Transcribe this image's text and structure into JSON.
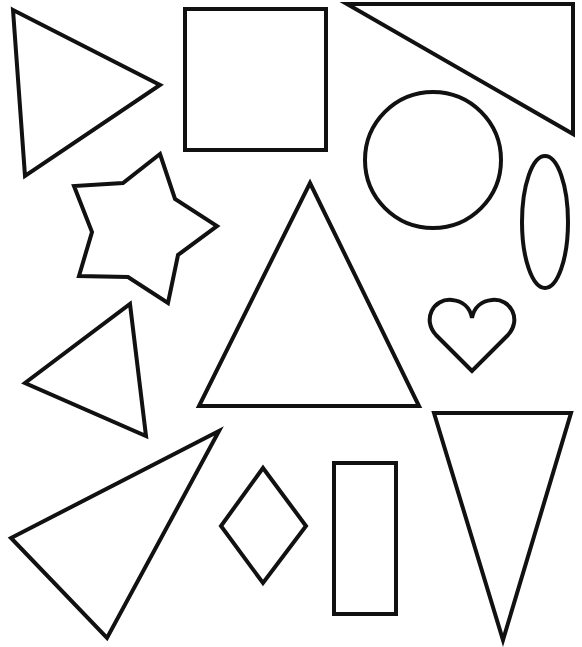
{
  "worksheet": {
    "background": "#ffffff",
    "stroke_color": "#111111",
    "stroke_width": 4,
    "shapes": [
      {
        "id": "triangle-1",
        "type": "triangle",
        "points": "13,10 160,85 25,176"
      },
      {
        "id": "square-1",
        "type": "square",
        "x": 185,
        "y": 9,
        "w": 141,
        "h": 141
      },
      {
        "id": "right-triangle-1",
        "type": "right-triangle",
        "points": "347,4 573,4 573,134"
      },
      {
        "id": "circle-1",
        "type": "circle",
        "cx": 433,
        "cy": 160,
        "r": 68
      },
      {
        "id": "ellipse-1",
        "type": "ellipse",
        "cx": 545,
        "cy": 222,
        "rx": 23,
        "ry": 66
      },
      {
        "id": "star-1",
        "type": "star",
        "points": "160,154 175,199 217,226 178,255 168,303 128,277 79,276 92,232 74,186 123,183"
      },
      {
        "id": "triangle-2",
        "type": "triangle",
        "points": "310,183 419,406 199,406"
      },
      {
        "id": "heart-1",
        "type": "heart",
        "path": "M 472,371 L 436,335 C 422,320 433,298 452,300 C 462,301 470,307 472,318 C 474,307 482,301 492,300 C 511,298 522,320 508,335 Z"
      },
      {
        "id": "triangle-3",
        "type": "triangle",
        "points": "130,304 146,436 25,383"
      },
      {
        "id": "triangle-4",
        "type": "triangle",
        "points": "219,431 107,638 11,538"
      },
      {
        "id": "rhombus-1",
        "type": "rhombus",
        "points": "263,468 306,526 263,583 221,526"
      },
      {
        "id": "rectangle-1",
        "type": "rectangle",
        "x": 334,
        "y": 463,
        "w": 62,
        "h": 151
      },
      {
        "id": "triangle-5",
        "type": "inverted-triangle",
        "points": "434,413 571,413 503,640"
      }
    ]
  }
}
